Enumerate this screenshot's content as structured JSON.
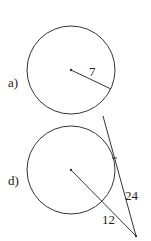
{
  "figures": [
    {
      "label": "a)",
      "radius_label": "7"
    },
    {
      "label": "d)",
      "segment_label": "12",
      "tangent_label": "24"
    }
  ],
  "colors": {
    "stroke": "#333333",
    "background": "#ffffff"
  }
}
